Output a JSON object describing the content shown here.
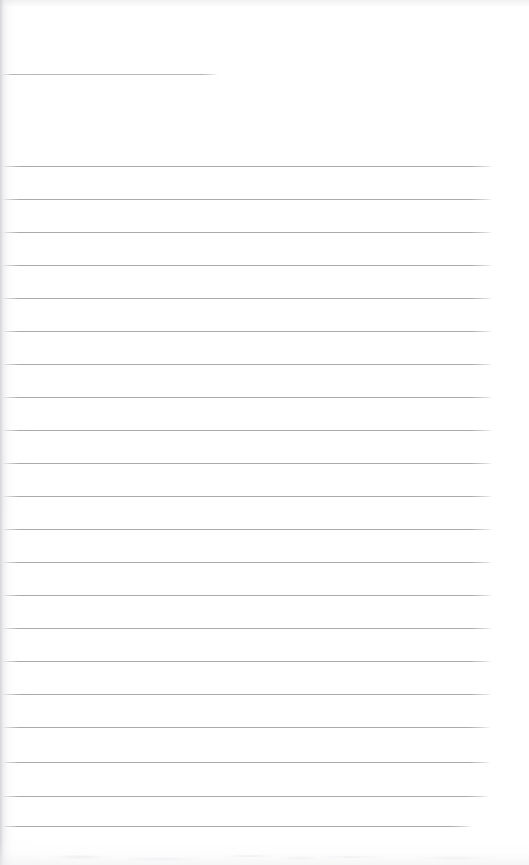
{
  "document": {
    "kind": "scanned-page",
    "title": "Blank ruled page",
    "page_width": 529,
    "page_height": 865,
    "background_color": "#ffffff",
    "rule_color": "#aaaaaf",
    "header_rule_color": "#b5b5ba",
    "edge_shadow_color": "#c4c4c8",
    "body_text": "",
    "written_content": "",
    "visible_text_elements": []
  },
  "header_rule": {
    "name": "header-rule",
    "x": 2,
    "y": 74,
    "width": 216,
    "thickness": 1
  },
  "ruled_area": {
    "name": "ruled-lines",
    "left": 2,
    "right": 493,
    "width": 491,
    "first_line_y": 166,
    "line_spacing": 33,
    "line_count": 21,
    "thickness": 1,
    "lines": [
      {
        "index": 1,
        "y": 166,
        "x": 2,
        "width": 491
      },
      {
        "index": 2,
        "y": 199,
        "x": 2,
        "width": 491
      },
      {
        "index": 3,
        "y": 232,
        "x": 2,
        "width": 491
      },
      {
        "index": 4,
        "y": 265,
        "x": 2,
        "width": 491
      },
      {
        "index": 5,
        "y": 298,
        "x": 2,
        "width": 491
      },
      {
        "index": 6,
        "y": 331,
        "x": 2,
        "width": 491
      },
      {
        "index": 7,
        "y": 364,
        "x": 2,
        "width": 491
      },
      {
        "index": 8,
        "y": 397,
        "x": 2,
        "width": 491
      },
      {
        "index": 9,
        "y": 430,
        "x": 2,
        "width": 491
      },
      {
        "index": 10,
        "y": 463,
        "x": 2,
        "width": 491
      },
      {
        "index": 11,
        "y": 496,
        "x": 2,
        "width": 491
      },
      {
        "index": 12,
        "y": 529,
        "x": 2,
        "width": 491
      },
      {
        "index": 13,
        "y": 562,
        "x": 2,
        "width": 491
      },
      {
        "index": 14,
        "y": 595,
        "x": 2,
        "width": 491
      },
      {
        "index": 15,
        "y": 628,
        "x": 2,
        "width": 491
      },
      {
        "index": 16,
        "y": 661,
        "x": 2,
        "width": 490
      },
      {
        "index": 17,
        "y": 694,
        "x": 2,
        "width": 490
      },
      {
        "index": 18,
        "y": 727,
        "x": 2,
        "width": 489
      },
      {
        "index": 19,
        "y": 762,
        "x": 2,
        "width": 489
      },
      {
        "index": 20,
        "y": 796,
        "x": 2,
        "width": 487
      },
      {
        "index": 21,
        "y": 826,
        "x": 2,
        "width": 470
      }
    ]
  }
}
